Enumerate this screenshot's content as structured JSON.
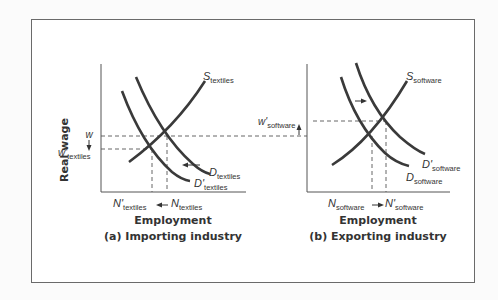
{
  "figure": {
    "y_axis_label": "Real wage",
    "panels": [
      {
        "id": "a",
        "xlabel": "Employment",
        "caption": "(a) Importing industry",
        "supply_label": {
          "main": "S",
          "sub": "textiles"
        },
        "demand_label": {
          "main": "D",
          "sub": "textiles"
        },
        "demand_new_label": {
          "main": "D'",
          "sub": "textiles"
        },
        "wage_label": {
          "main": "w",
          "sub": ""
        },
        "wage_new_label": {
          "main": "w'",
          "sub": "textiles"
        },
        "employment_label": {
          "main": "N",
          "sub": "textiles"
        },
        "employment_new_label": {
          "main": "N'",
          "sub": "textiles"
        },
        "shift": "demand shifts left; wage and employment fall"
      },
      {
        "id": "b",
        "xlabel": "Employment",
        "caption": "(b) Exporting industry",
        "supply_label": {
          "main": "S",
          "sub": "software"
        },
        "demand_label": {
          "main": "D",
          "sub": "software"
        },
        "demand_new_label": {
          "main": "D'",
          "sub": "software"
        },
        "wage_new_label": {
          "main": "w'",
          "sub": "software"
        },
        "employment_label": {
          "main": "N",
          "sub": "software"
        },
        "employment_new_label": {
          "main": "N'",
          "sub": "software"
        },
        "shift": "demand shifts right; wage and employment rise"
      }
    ],
    "colors": {
      "curve": "#3a3a3a",
      "axis": "#555555",
      "dash": "#555555",
      "frame": "#6a6a6a"
    }
  }
}
